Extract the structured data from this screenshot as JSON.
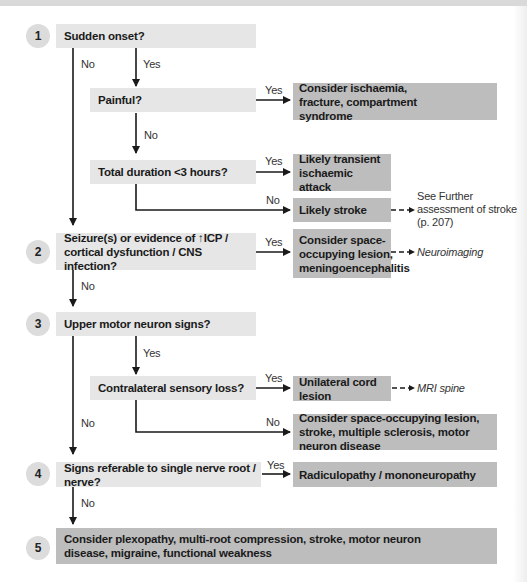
{
  "diagram": {
    "title": "",
    "steps": [
      {
        "number": "1",
        "question": "Sudden onset?"
      },
      {
        "number": "2",
        "question": "Seizure(s) or evidence of ↑ICP / cortical dysfunction / CNS infection?"
      },
      {
        "number": "3",
        "question": "Upper motor neuron signs?"
      },
      {
        "number": "4",
        "question": "Signs referable to single nerve root / nerve?"
      },
      {
        "number": "5",
        "question": "Consider plexopathy, multi-root compression, stroke, motor neuron disease, migraine, functional weakness"
      }
    ],
    "sub_questions": {
      "painful": "Painful?",
      "total_duration": "Total duration <3 hours?",
      "contralateral": "Contralateral sensory loss?"
    },
    "outcomes": {
      "ischaemia": "Consider ischaemia, fracture, compartment syndrome",
      "tia": "Likely transient ischaemic attack",
      "stroke": "Likely stroke",
      "space_occupying": "Consider space-occupying lesion, meningoencephalitis",
      "unilateral_cord": "Unilateral cord lesion",
      "space_occupying_stroke": "Consider space-occupying lesion, stroke, multiple sclerosis, motor neuron disease",
      "radiculopathy": "Radiculopathy / mononeuropathy"
    },
    "notes": {
      "stroke_ref_line1": "See Further",
      "stroke_ref_line2": "assessment of stroke",
      "stroke_ref_line3": "(p. 207)",
      "neuroimaging": "Neuroimaging",
      "mri_spine": "MRI spine"
    },
    "labels": {
      "yes": "Yes",
      "no": "No"
    },
    "colors": {
      "question_fill": "#e6e6e6",
      "outcome_fill": "#bdbdbd",
      "step_circle": "#dcdcdc",
      "line": "#1a1a1a"
    }
  }
}
